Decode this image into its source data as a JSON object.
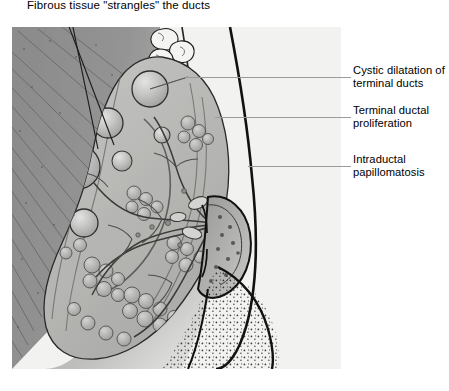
{
  "figure": {
    "title": "Fibrous tissue \"strangles\" the ducts",
    "labels": [
      {
        "id": "cystic-dilatation",
        "text": "Cystic dilatation of\nterminal ducts"
      },
      {
        "id": "terminal-ductal-proliferation",
        "text": "Terminal ductal\nproliferation"
      },
      {
        "id": "intraductal-papillomatosis",
        "text": "Intraductal\npapillomatosis"
      }
    ],
    "colors": {
      "page_background": "#ffffff",
      "panel_background": "#f2f2f0",
      "muscle_gray": "#8d8d8d",
      "fibrous_stroma": "#b9b9b7",
      "glandular_gray": "#a9a9a7",
      "cyst_fill": "#c9c9c7",
      "outline": "#000000",
      "leader_line": "#9a9a9a",
      "text": "#000000"
    },
    "structures": [
      "pectoralis muscle striations",
      "subcutaneous fat lobules",
      "fibrous stroma band",
      "dilated cysts",
      "glandular lobules",
      "lactiferous ducts",
      "nipple and areola",
      "breast skin contour",
      "stippled fatty shading"
    ]
  }
}
